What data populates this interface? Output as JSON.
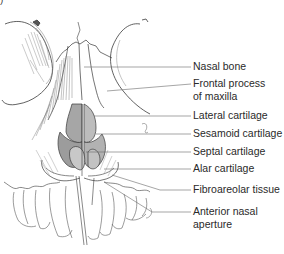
{
  "figure": {
    "panel_marker": ")"
  },
  "labels": [
    {
      "id": "nasal-bone",
      "line1": "Nasal bone",
      "line2": ""
    },
    {
      "id": "frontal-process-of-maxilla",
      "line1": "Frontal process",
      "line2": "of maxilla"
    },
    {
      "id": "lateral-cartilage",
      "line1": "Lateral cartilage",
      "line2": ""
    },
    {
      "id": "sesamoid-cartilage",
      "line1": "Sesamoid cartilage",
      "line2": ""
    },
    {
      "id": "septal-cartilage",
      "line1": "Septal cartilage",
      "line2": ""
    },
    {
      "id": "alar-cartilage",
      "line1": "Alar cartilage",
      "line2": ""
    },
    {
      "id": "fibroareolar-tissue",
      "line1": "Fibroareolar tissue",
      "line2": ""
    },
    {
      "id": "anterior-nasal-aperture",
      "line1": "Anterior nasal",
      "line2": "aperture"
    }
  ],
  "colors": {
    "ink": "#3a3a3a",
    "leader": "#6a6a6a",
    "shade": "#8a8a8a",
    "background": "#ffffff"
  }
}
